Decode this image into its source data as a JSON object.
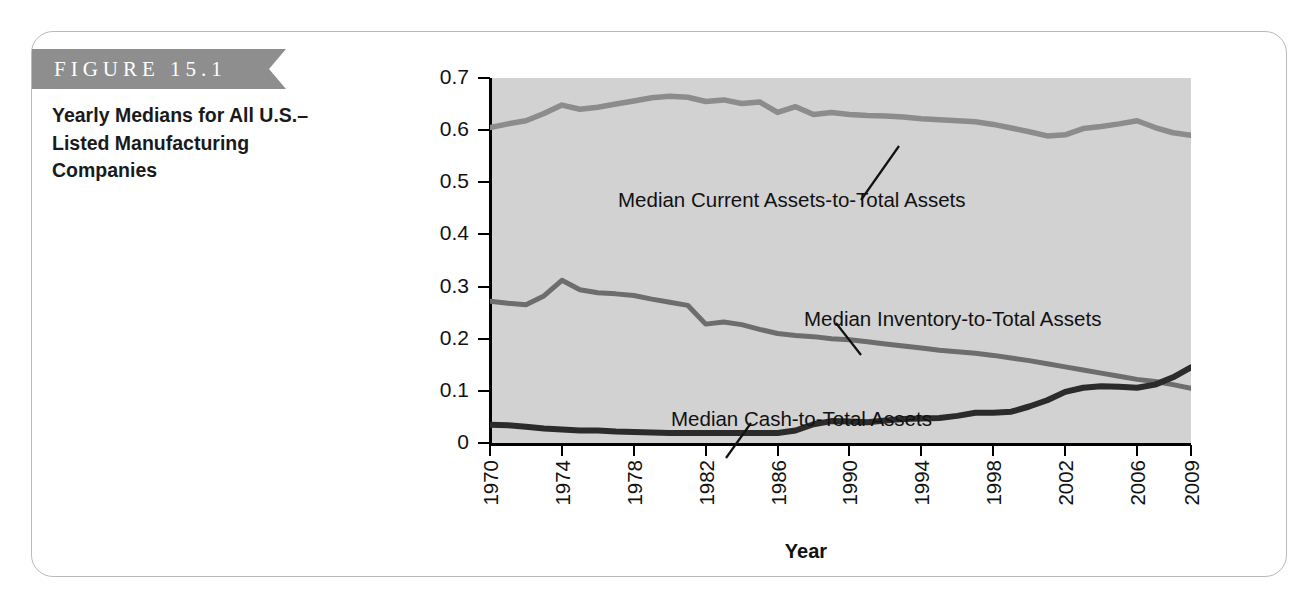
{
  "figure": {
    "banner_label": "FIGURE 15.1",
    "caption": "Yearly Medians for All U.S.–Listed Manufacturing Companies",
    "banner_color": "#8e8e8e",
    "frame_color": "#b9b9b9"
  },
  "chart_data": {
    "type": "line",
    "xlabel": "Year",
    "ylabel": "",
    "plot_background": "#d2d2d2",
    "grid": false,
    "legend_position": "inline-annotations",
    "xlim": [
      1970,
      2009
    ],
    "ylim": [
      0,
      0.7
    ],
    "yticks": [
      "0",
      "0.1",
      "0.2",
      "0.3",
      "0.4",
      "0.5",
      "0.6",
      "0.7"
    ],
    "ytick_values": [
      0,
      0.1,
      0.2,
      0.3,
      0.4,
      0.5,
      0.6,
      0.7
    ],
    "xticks": [
      "1970",
      "1974",
      "1978",
      "1982",
      "1986",
      "1990",
      "1994",
      "1998",
      "2002",
      "2006",
      "2009"
    ],
    "xtick_values": [
      1970,
      1974,
      1978,
      1982,
      1986,
      1990,
      1994,
      1998,
      2002,
      2006,
      2009
    ],
    "x": [
      1970,
      1971,
      1972,
      1973,
      1974,
      1975,
      1976,
      1977,
      1978,
      1979,
      1980,
      1981,
      1982,
      1983,
      1984,
      1985,
      1986,
      1987,
      1988,
      1989,
      1990,
      1991,
      1992,
      1993,
      1994,
      1995,
      1996,
      1997,
      1998,
      1999,
      2000,
      2001,
      2002,
      2003,
      2004,
      2005,
      2006,
      2007,
      2008,
      2009
    ],
    "series": [
      {
        "name": "Median Current Assets-to-Total Assets",
        "color": "#8c8c8c",
        "values": [
          0.605,
          0.612,
          0.618,
          0.632,
          0.648,
          0.64,
          0.644,
          0.65,
          0.656,
          0.662,
          0.665,
          0.663,
          0.655,
          0.658,
          0.651,
          0.654,
          0.634,
          0.645,
          0.63,
          0.634,
          0.63,
          0.628,
          0.627,
          0.625,
          0.622,
          0.62,
          0.618,
          0.616,
          0.611,
          0.604,
          0.597,
          0.589,
          0.591,
          0.603,
          0.607,
          0.612,
          0.618,
          0.605,
          0.595,
          0.59
        ]
      },
      {
        "name": "Median Inventory-to-Total Assets",
        "color": "#6d6d6d",
        "values": [
          0.272,
          0.268,
          0.265,
          0.282,
          0.312,
          0.294,
          0.288,
          0.286,
          0.283,
          0.276,
          0.27,
          0.264,
          0.228,
          0.232,
          0.227,
          0.218,
          0.21,
          0.206,
          0.204,
          0.2,
          0.198,
          0.194,
          0.19,
          0.186,
          0.182,
          0.178,
          0.175,
          0.172,
          0.168,
          0.163,
          0.158,
          0.152,
          0.146,
          0.14,
          0.134,
          0.128,
          0.122,
          0.118,
          0.112,
          0.105
        ]
      },
      {
        "name": "Median Cash-to-Total Assets",
        "color": "#2b2b2b",
        "values": [
          0.035,
          0.034,
          0.031,
          0.028,
          0.026,
          0.024,
          0.024,
          0.022,
          0.021,
          0.02,
          0.019,
          0.019,
          0.019,
          0.019,
          0.019,
          0.019,
          0.019,
          0.024,
          0.036,
          0.042,
          0.041,
          0.04,
          0.043,
          0.046,
          0.047,
          0.048,
          0.052,
          0.058,
          0.058,
          0.06,
          0.07,
          0.082,
          0.098,
          0.106,
          0.109,
          0.108,
          0.106,
          0.112,
          0.126,
          0.145
        ]
      }
    ],
    "annotations": [
      {
        "text": "Median Current Assets-to-Total Assets",
        "series": "Median Current Assets-to-Total Assets"
      },
      {
        "text": "Median Inventory-to-Total Assets",
        "series": "Median Inventory-to-Total Assets"
      },
      {
        "text": "Median Cash-to-Total Assets",
        "series": "Median Cash-to-Total Assets"
      }
    ]
  }
}
